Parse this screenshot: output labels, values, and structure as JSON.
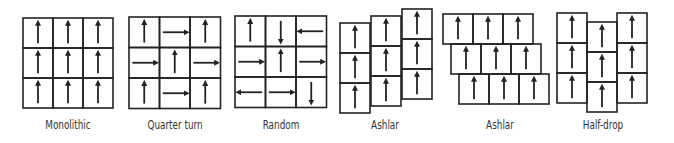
{
  "colors": {
    "stroke": "#222222",
    "text": "#333333",
    "background": "#ffffff"
  },
  "patterns": [
    {
      "label": "Monolithic",
      "type": "grid",
      "x": 23,
      "y": 18,
      "cell": 30,
      "arrows": [
        [
          "up",
          "up",
          "up"
        ],
        [
          "up",
          "up",
          "up"
        ],
        [
          "up",
          "up",
          "up"
        ]
      ]
    },
    {
      "label": "Quarter turn",
      "type": "grid",
      "x": 129,
      "y": 17,
      "cell": 30.5,
      "arrows": [
        [
          "up",
          "right",
          "up"
        ],
        [
          "right",
          "up",
          "right"
        ],
        [
          "up",
          "right",
          "up"
        ]
      ]
    },
    {
      "label": "Random",
      "type": "grid",
      "x": 235,
      "y": 16,
      "cell": 30.5,
      "arrows": [
        [
          "up",
          "down",
          "left"
        ],
        [
          "right",
          "up",
          "right"
        ],
        [
          "left",
          "right",
          "down"
        ]
      ]
    },
    {
      "label": "Ashlar",
      "type": "ashlar-vertical",
      "cell": 30,
      "columns": [
        {
          "x": 340,
          "y": 23
        },
        {
          "x": 371,
          "y": 16
        },
        {
          "x": 402,
          "y": 9
        }
      ],
      "arrows": "up"
    },
    {
      "label": "Ashlar",
      "type": "ashlar-horizontal",
      "cell": 30,
      "rows": [
        {
          "x": 443,
          "y": 14
        },
        {
          "x": 451,
          "y": 44
        },
        {
          "x": 459,
          "y": 74
        }
      ],
      "arrows": "up"
    },
    {
      "label": "Half-drop",
      "type": "half-drop",
      "cell": 30,
      "columns": [
        {
          "x": 557,
          "y": 13
        },
        {
          "x": 587,
          "y": 22
        },
        {
          "x": 617,
          "y": 13
        }
      ],
      "arrows": "up"
    }
  ],
  "labels": {
    "monolithic": "Monolithic",
    "quarter_turn": "Quarter turn",
    "random": "Random",
    "ashlar_1": "Ashlar",
    "ashlar_2": "Ashlar",
    "half_drop": "Half-drop"
  }
}
